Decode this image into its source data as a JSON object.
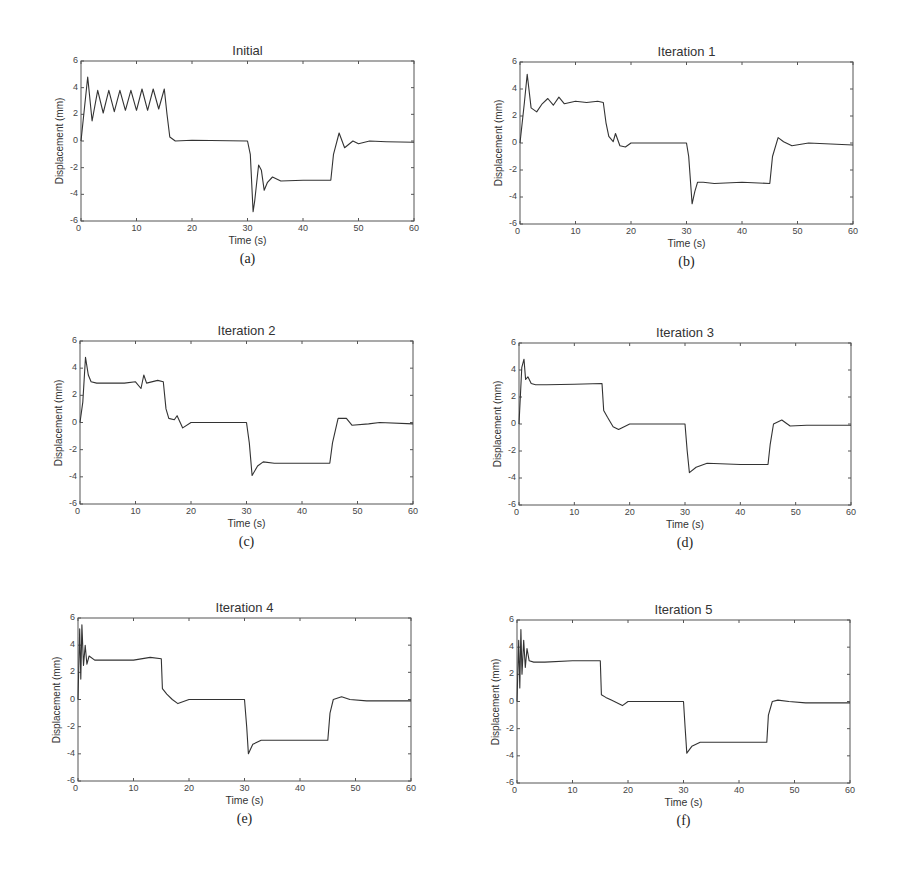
{
  "figure": {
    "caption_partial": "Figure 6.34: Displacement response — initial and iterations 1–5 (caption cut off)"
  },
  "axes_common": {
    "xlabel": "Time (s)",
    "ylabel": "Displacement (mm)",
    "xticks": [
      "0",
      "10",
      "20",
      "30",
      "40",
      "50",
      "60"
    ],
    "yticks": [
      "6",
      "4",
      "2",
      "0",
      "-2",
      "-4",
      "-6"
    ]
  },
  "panels": [
    {
      "id": "a",
      "title": "Initial",
      "sub_label": "(a)"
    },
    {
      "id": "b",
      "title": "Iteration 1",
      "sub_label": "(b)"
    },
    {
      "id": "c",
      "title": "Iteration 2",
      "sub_label": "(c)"
    },
    {
      "id": "d",
      "title": "Iteration 3",
      "sub_label": "(d)"
    },
    {
      "id": "e",
      "title": "Iteration 4",
      "sub_label": "(e)"
    },
    {
      "id": "f",
      "title": "Iteration 5",
      "sub_label": "(f)"
    }
  ],
  "chart_data": [
    {
      "type": "line",
      "title": "Initial",
      "xlabel": "Time (s)",
      "ylabel": "Displacement (mm)",
      "xlim": [
        0,
        60
      ],
      "ylim": [
        -6,
        6
      ],
      "grid": false,
      "legend": "none",
      "x": [
        0,
        0.5,
        1.2,
        2,
        3,
        4,
        5,
        6,
        7,
        8,
        9,
        10,
        11,
        12,
        13,
        14,
        15,
        15.5,
        16,
        17,
        20,
        30,
        30.5,
        31,
        31.3,
        32,
        32.5,
        33,
        33.6,
        34.5,
        36,
        40,
        45,
        45.5,
        46.5,
        47.5,
        49,
        50,
        52,
        55,
        60
      ],
      "values": [
        0,
        2,
        4.8,
        1.5,
        3.8,
        2.1,
        3.8,
        2.2,
        3.8,
        2.3,
        3.8,
        2.3,
        3.9,
        2.3,
        3.9,
        2.4,
        3.9,
        2.0,
        0.3,
        0,
        0.05,
        0,
        -1,
        -5.3,
        -4.5,
        -1.8,
        -2.2,
        -3.7,
        -3.1,
        -2.7,
        -3.0,
        -2.95,
        -2.95,
        -1,
        0.6,
        -0.5,
        0,
        -0.2,
        0,
        -0.05,
        -0.1
      ]
    },
    {
      "type": "line",
      "title": "Iteration 1",
      "xlabel": "Time (s)",
      "ylabel": "Displacement (mm)",
      "xlim": [
        0,
        60
      ],
      "ylim": [
        -6,
        6
      ],
      "grid": false,
      "legend": "none",
      "x": [
        0,
        0.8,
        1.3,
        2,
        3,
        4,
        5,
        6,
        7,
        8,
        10,
        12,
        14,
        15,
        15.5,
        16,
        16.8,
        17.2,
        18,
        19,
        20,
        25,
        30,
        30.4,
        31,
        31.5,
        32,
        33,
        35,
        40,
        45,
        45.5,
        46.5,
        47.5,
        49,
        52,
        60
      ],
      "values": [
        0,
        3,
        5.1,
        2.6,
        2.3,
        2.9,
        3.3,
        2.8,
        3.4,
        2.9,
        3.1,
        3.0,
        3.1,
        3.0,
        1.5,
        0.5,
        0.1,
        0.7,
        -0.2,
        -0.3,
        0,
        0,
        0,
        -1,
        -4.5,
        -3.6,
        -2.9,
        -2.9,
        -3.0,
        -2.9,
        -3.0,
        -1,
        0.4,
        0.1,
        -0.2,
        0,
        -0.15
      ]
    },
    {
      "type": "line",
      "title": "Iteration 2",
      "xlabel": "Time (s)",
      "ylabel": "Displacement (mm)",
      "xlim": [
        0,
        60
      ],
      "ylim": [
        -6,
        6
      ],
      "grid": false,
      "legend": "none",
      "x": [
        0,
        0.5,
        1,
        1.5,
        2,
        3,
        5,
        8,
        10,
        11,
        11.5,
        12,
        14,
        15,
        15.5,
        16,
        17,
        17.5,
        18.5,
        20,
        25,
        30,
        30.5,
        31,
        32,
        33,
        35,
        40,
        45,
        45.5,
        46.5,
        48,
        49,
        52,
        54,
        60
      ],
      "values": [
        0,
        1.5,
        4.8,
        3.5,
        3.0,
        2.9,
        2.9,
        2.9,
        3.0,
        2.5,
        3.5,
        2.9,
        3.1,
        3.0,
        1.0,
        0.3,
        0.2,
        0.5,
        -0.4,
        0,
        0,
        0,
        -1.5,
        -3.9,
        -3.2,
        -2.9,
        -3.0,
        -3.0,
        -3.0,
        -1.5,
        0.3,
        0.3,
        -0.2,
        -0.1,
        0,
        -0.1
      ]
    },
    {
      "type": "line",
      "title": "Iteration 3",
      "xlabel": "Time (s)",
      "ylabel": "Displacement (mm)",
      "xlim": [
        0,
        60
      ],
      "ylim": [
        -6,
        6
      ],
      "grid": false,
      "legend": "none",
      "x": [
        0,
        0.5,
        0.9,
        1.2,
        1.6,
        2.2,
        3,
        5,
        10,
        15,
        15.3,
        16,
        17,
        18,
        20,
        25,
        30,
        30.4,
        30.8,
        32,
        34,
        40,
        45,
        45.4,
        46,
        47.5,
        49,
        52,
        60
      ],
      "values": [
        0,
        4.2,
        4.8,
        3.3,
        3.5,
        3.0,
        2.9,
        2.9,
        2.95,
        3.0,
        1.0,
        0.5,
        -0.2,
        -0.4,
        0,
        0,
        0,
        -2,
        -3.6,
        -3.2,
        -2.9,
        -3.0,
        -3.0,
        -1.5,
        0,
        0.3,
        -0.15,
        -0.1,
        -0.1
      ]
    },
    {
      "type": "line",
      "title": "Iteration 4",
      "xlabel": "Time (s)",
      "ylabel": "Displacement (mm)",
      "xlim": [
        0,
        60
      ],
      "ylim": [
        -6,
        6
      ],
      "grid": false,
      "legend": "none",
      "x": [
        0,
        0.3,
        0.5,
        0.7,
        1.0,
        1.3,
        1.6,
        2.0,
        3,
        5,
        10,
        13,
        15,
        15.2,
        16,
        17,
        18,
        20,
        25,
        30,
        30.4,
        30.7,
        31.5,
        33,
        35,
        40,
        45,
        45.4,
        46,
        47.5,
        49,
        52,
        60
      ],
      "values": [
        0,
        5.2,
        1.5,
        5.5,
        2.5,
        4.0,
        2.6,
        3.2,
        2.9,
        2.9,
        2.9,
        3.1,
        3.0,
        0.8,
        0.4,
        0.0,
        -0.3,
        0,
        0,
        0,
        -2,
        -4.0,
        -3.3,
        -3.0,
        -3.0,
        -3.0,
        -3.0,
        -1,
        0,
        0.2,
        0,
        -0.1,
        -0.1
      ]
    },
    {
      "type": "line",
      "title": "Iteration 5",
      "xlabel": "Time (s)",
      "ylabel": "Displacement (mm)",
      "xlim": [
        0,
        60
      ],
      "ylim": [
        -6,
        6
      ],
      "grid": false,
      "legend": "none",
      "x": [
        0,
        0.3,
        0.5,
        0.7,
        0.9,
        1.2,
        1.5,
        1.8,
        2.2,
        3,
        5,
        10,
        15,
        15.2,
        16,
        17,
        19,
        20,
        25,
        30,
        30.3,
        30.6,
        31.5,
        33,
        35,
        40,
        45,
        45.3,
        46,
        47,
        49,
        52,
        60
      ],
      "values": [
        0,
        4.5,
        1.0,
        5.3,
        2.0,
        4.5,
        2.5,
        3.9,
        3.0,
        2.9,
        2.9,
        3.0,
        3.0,
        0.5,
        0.3,
        0.1,
        -0.3,
        0,
        0,
        0,
        -2,
        -3.8,
        -3.3,
        -3.0,
        -3.0,
        -3.0,
        -3.0,
        -1,
        0,
        0.1,
        0,
        -0.1,
        -0.1
      ]
    }
  ]
}
